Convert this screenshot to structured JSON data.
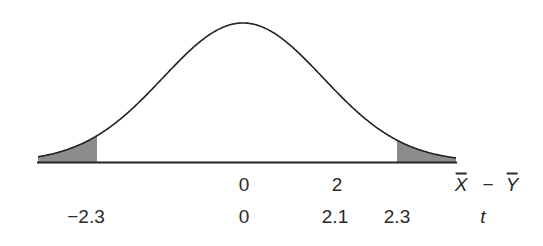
{
  "chart_data": {
    "type": "line",
    "title": "",
    "distribution": {
      "mean": 0,
      "shape": "bell-curve"
    },
    "axes": [
      {
        "name": "xbar_minus_ybar",
        "label_parts": [
          "X",
          "−",
          "Y"
        ],
        "label_overbar": [
          true,
          false,
          true
        ],
        "ticks": [
          {
            "value": 0,
            "label": "0"
          },
          {
            "value": 2,
            "label": "2"
          }
        ]
      },
      {
        "name": "t",
        "label": "t",
        "ticks": [
          {
            "value": -2.3,
            "label": "−2.3"
          },
          {
            "value": 0,
            "label": "0"
          },
          {
            "value": 2.1,
            "label": "2.1"
          },
          {
            "value": 2.3,
            "label": "2.3"
          }
        ]
      }
    ],
    "shaded_regions": [
      {
        "from": "-inf",
        "to": -2.3,
        "axis": "t",
        "color": "#8c8c8c"
      },
      {
        "from": 2.3,
        "to": "inf",
        "axis": "t",
        "color": "#8c8c8c"
      }
    ],
    "grid": false,
    "legend": null
  },
  "labels": {
    "row1": {
      "zero": "0",
      "two": "2",
      "x": "X",
      "minus": "−",
      "y": "Y"
    },
    "row2": {
      "neg": "−2.3",
      "zero": "0",
      "two_one": "2.1",
      "two_three": "2.3",
      "t": "t"
    }
  },
  "style": {
    "curve_color": "#222222",
    "shade_color": "#8c8c8c",
    "axis_color": "#222222"
  }
}
